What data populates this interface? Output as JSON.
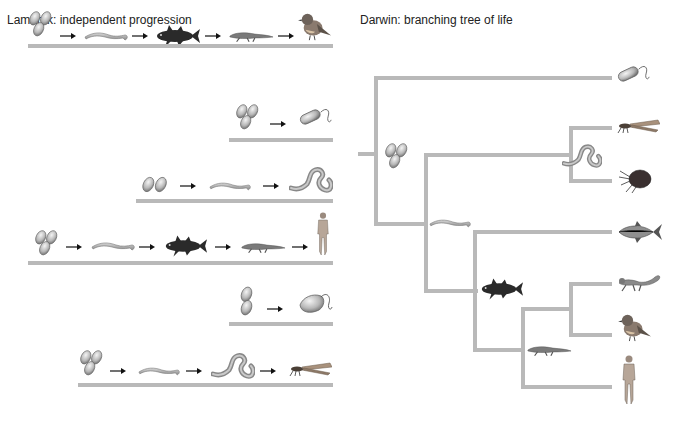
{
  "lamarck": {
    "title": "Lamarck: independent progression",
    "rows": [
      {
        "sequence": [
          "prokaryote cells",
          "flatworm",
          "coelacanth",
          "amphibian",
          "bird"
        ]
      },
      {
        "sequence": [
          "prokaryote cells",
          "bacterium"
        ]
      },
      {
        "sequence": [
          "prokaryote cells",
          "flatworm",
          "annelid worm"
        ]
      },
      {
        "sequence": [
          "prokaryote cells",
          "flatworm",
          "coelacanth",
          "amphibian",
          "human"
        ]
      },
      {
        "sequence": [
          "prokaryote cells",
          "protist"
        ]
      },
      {
        "sequence": [
          "prokaryote cells",
          "flatworm",
          "annelid worm",
          "insect"
        ]
      }
    ]
  },
  "darwin": {
    "title": "Darwin: branching tree of life",
    "tips": [
      "bacterium",
      "insect",
      "crustacean",
      "fish",
      "lizard",
      "bird",
      "human"
    ],
    "ancestors": [
      "prokaryote cells",
      "flatworm",
      "annelid worm",
      "coelacanth",
      "amphibian"
    ]
  },
  "colors": {
    "line": "#b9b9b9",
    "text": "#222222"
  }
}
